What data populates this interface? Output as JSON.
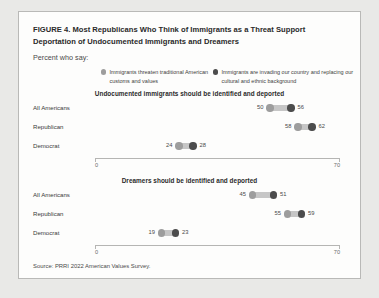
{
  "figure": {
    "title": "FIGURE 4.  Most Republicans Who Think of Immigrants as a Threat Support Deportation of Undocumented Immigrants and Dreamers",
    "subtitle": "Percent who say:",
    "source": "Source: PRRI 2022 American Values Survey."
  },
  "legend": [
    {
      "label": "Immigrants threaten traditional American customs  and values",
      "color": "#9d9d9d",
      "key": "threaten"
    },
    {
      "label": "Immigrants are invading our country and replacing our cultural and ethnic background",
      "color": "#4c4c4c",
      "key": "invading"
    }
  ],
  "chart_data": [
    {
      "type": "bar",
      "title": "Undocumented immigrants should be identified and deported",
      "xlabel": "",
      "ylabel": "",
      "xlim": [
        0,
        70
      ],
      "ticks": [
        "0",
        "70"
      ],
      "grid": false,
      "legend_position": "top",
      "categories": [
        "All Americans",
        "Republican",
        "Democrat"
      ],
      "series": [
        {
          "name": "Immigrants threaten traditional American customs  and values",
          "values": [
            50,
            58,
            24
          ]
        },
        {
          "name": "Immigrants are invading our country and replacing our cultural and ethnic background",
          "values": [
            56,
            62,
            28
          ]
        }
      ]
    },
    {
      "type": "bar",
      "title": "Dreamers should be identified and deported",
      "xlabel": "",
      "ylabel": "",
      "xlim": [
        0,
        70
      ],
      "ticks": [
        "0",
        "70"
      ],
      "grid": false,
      "legend_position": "top",
      "categories": [
        "All Americans",
        "Republican",
        "Democrat"
      ],
      "series": [
        {
          "name": "Immigrants threaten traditional American customs  and values",
          "values": [
            45,
            55,
            19
          ]
        },
        {
          "name": "Immigrants are invading our country and replacing our cultural and ethnic background",
          "values": [
            51,
            59,
            23
          ]
        }
      ]
    }
  ]
}
